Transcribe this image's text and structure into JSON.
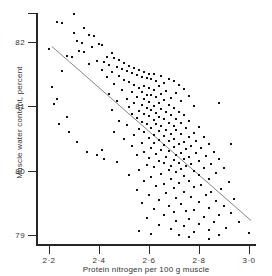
{
  "chart_data": {
    "type": "scatter",
    "title": "",
    "subtitle": "",
    "xlabel": "Protein nitrogen per 100 g muscle",
    "ylabel": "Muscle water content, percent",
    "xlim": [
      2.15,
      3.03
    ],
    "ylim": [
      78.85,
      82.45
    ],
    "grid": false,
    "legend": null,
    "annotations": [],
    "xticks": [
      {
        "value": 2.2,
        "label": "2·2"
      },
      {
        "value": 2.4,
        "label": "2·4"
      },
      {
        "value": 2.6,
        "label": "2·6"
      },
      {
        "value": 2.8,
        "label": "2·8"
      },
      {
        "value": 3.0,
        "label": "3·0"
      }
    ],
    "yticks": [
      {
        "value": 82.45,
        "label": ""
      },
      {
        "value": 82.0,
        "label": "82"
      },
      {
        "value": 81.0,
        "label": "81"
      },
      {
        "value": 80.0,
        "label": "80"
      },
      {
        "value": 79.0,
        "label": "79"
      }
    ],
    "marker": {
      "shape": "square",
      "size_px": 2,
      "color": "#111111"
    },
    "n_points": 248,
    "series": [
      {
        "name": "observations",
        "color": "#111111",
        "points": [
          [
            2.3,
            82.44
          ],
          [
            2.23,
            82.31
          ],
          [
            2.25,
            82.3
          ],
          [
            2.34,
            82.22
          ],
          [
            2.3,
            82.14
          ],
          [
            2.36,
            82.11
          ],
          [
            2.38,
            82.1
          ],
          [
            2.31,
            82.02
          ],
          [
            2.33,
            81.98
          ],
          [
            2.4,
            81.97
          ],
          [
            2.37,
            81.93
          ],
          [
            2.41,
            81.95
          ],
          [
            2.2,
            81.89
          ],
          [
            2.32,
            81.86
          ],
          [
            2.34,
            81.84
          ],
          [
            2.45,
            81.83
          ],
          [
            2.27,
            81.78
          ],
          [
            2.29,
            81.77
          ],
          [
            2.43,
            81.76
          ],
          [
            2.46,
            81.75
          ],
          [
            2.48,
            81.72
          ],
          [
            2.39,
            81.7
          ],
          [
            2.42,
            81.69
          ],
          [
            2.5,
            81.68
          ],
          [
            2.36,
            81.66
          ],
          [
            2.44,
            81.64
          ],
          [
            2.52,
            81.63
          ],
          [
            2.47,
            81.61
          ],
          [
            2.54,
            81.6
          ],
          [
            2.49,
            81.58
          ],
          [
            2.41,
            81.57
          ],
          [
            2.56,
            81.56
          ],
          [
            2.51,
            81.55
          ],
          [
            2.58,
            81.54
          ],
          [
            2.45,
            81.53
          ],
          [
            2.53,
            81.52
          ],
          [
            2.6,
            81.51
          ],
          [
            2.62,
            81.5
          ],
          [
            2.55,
            81.49
          ],
          [
            2.48,
            81.48
          ],
          [
            2.65,
            81.47
          ],
          [
            2.57,
            81.46
          ],
          [
            2.43,
            81.45
          ],
          [
            2.59,
            81.44
          ],
          [
            2.68,
            81.43
          ],
          [
            2.61,
            81.42
          ],
          [
            2.5,
            81.41
          ],
          [
            2.63,
            81.4
          ],
          [
            2.7,
            81.39
          ],
          [
            2.52,
            81.38
          ],
          [
            2.66,
            81.36
          ],
          [
            2.46,
            81.35
          ],
          [
            2.54,
            81.34
          ],
          [
            2.72,
            81.33
          ],
          [
            2.58,
            81.32
          ],
          [
            2.64,
            81.31
          ],
          [
            2.21,
            81.3
          ],
          [
            2.56,
            81.29
          ],
          [
            2.6,
            81.28
          ],
          [
            2.74,
            81.27
          ],
          [
            2.62,
            81.26
          ],
          [
            2.49,
            81.25
          ],
          [
            2.67,
            81.24
          ],
          [
            2.53,
            81.23
          ],
          [
            2.57,
            81.22
          ],
          [
            2.71,
            81.21
          ],
          [
            2.44,
            81.2
          ],
          [
            2.65,
            81.19
          ],
          [
            2.59,
            81.18
          ],
          [
            2.61,
            81.17
          ],
          [
            2.76,
            81.16
          ],
          [
            2.55,
            81.15
          ],
          [
            2.63,
            81.14
          ],
          [
            2.69,
            81.13
          ],
          [
            2.51,
            81.12
          ],
          [
            2.58,
            81.11
          ],
          [
            2.66,
            81.1
          ],
          [
            2.47,
            81.09
          ],
          [
            2.73,
            81.08
          ],
          [
            2.6,
            81.07
          ],
          [
            2.54,
            81.06
          ],
          [
            2.64,
            81.05
          ],
          [
            2.22,
            81.04
          ],
          [
            2.68,
            81.03
          ],
          [
            2.57,
            81.02
          ],
          [
            2.62,
            81.01
          ],
          [
            2.78,
            81.0
          ],
          [
            2.52,
            80.99
          ],
          [
            2.7,
            80.98
          ],
          [
            2.59,
            80.97
          ],
          [
            2.65,
            80.96
          ],
          [
            2.45,
            80.95
          ],
          [
            2.61,
            80.94
          ],
          [
            2.56,
            80.93
          ],
          [
            2.72,
            80.92
          ],
          [
            2.67,
            80.91
          ],
          [
            2.63,
            80.9
          ],
          [
            2.58,
            80.89
          ],
          [
            2.53,
            80.88
          ],
          [
            2.74,
            80.87
          ],
          [
            2.69,
            80.86
          ],
          [
            2.6,
            80.85
          ],
          [
            2.64,
            80.84
          ],
          [
            2.27,
            80.83
          ],
          [
            2.55,
            80.82
          ],
          [
            2.71,
            80.81
          ],
          [
            2.66,
            80.8
          ],
          [
            2.62,
            80.79
          ],
          [
            2.48,
            80.78
          ],
          [
            2.76,
            80.77
          ],
          [
            2.57,
            80.76
          ],
          [
            2.68,
            80.75
          ],
          [
            2.73,
            80.74
          ],
          [
            2.63,
            80.73
          ],
          [
            2.59,
            80.72
          ],
          [
            2.51,
            80.71
          ],
          [
            2.7,
            80.7
          ],
          [
            2.65,
            80.69
          ],
          [
            2.8,
            80.68
          ],
          [
            2.61,
            80.67
          ],
          [
            2.75,
            80.66
          ],
          [
            2.56,
            80.65
          ],
          [
            2.67,
            80.64
          ],
          [
            2.71,
            80.63
          ],
          [
            2.64,
            80.62
          ],
          [
            2.46,
            80.61
          ],
          [
            2.58,
            80.6
          ],
          [
            2.78,
            80.59
          ],
          [
            2.69,
            80.58
          ],
          [
            2.73,
            80.57
          ],
          [
            2.62,
            80.56
          ],
          [
            2.54,
            80.55
          ],
          [
            2.66,
            80.54
          ],
          [
            2.82,
            80.53
          ],
          [
            2.76,
            80.52
          ],
          [
            2.6,
            80.51
          ],
          [
            2.7,
            80.5
          ],
          [
            2.5,
            80.49
          ],
          [
            2.64,
            80.48
          ],
          [
            2.79,
            80.47
          ],
          [
            2.68,
            80.46
          ],
          [
            2.74,
            80.45
          ],
          [
            2.57,
            80.44
          ],
          [
            2.62,
            80.43
          ],
          [
            2.84,
            80.42
          ],
          [
            2.72,
            80.41
          ],
          [
            2.66,
            80.4
          ],
          [
            2.77,
            80.39
          ],
          [
            2.53,
            80.38
          ],
          [
            2.7,
            80.37
          ],
          [
            2.61,
            80.36
          ],
          [
            2.81,
            80.35
          ],
          [
            2.75,
            80.34
          ],
          [
            2.65,
            80.33
          ],
          [
            2.41,
            80.32
          ],
          [
            2.68,
            80.31
          ],
          [
            2.86,
            80.3
          ],
          [
            2.58,
            80.29
          ],
          [
            2.73,
            80.28
          ],
          [
            2.79,
            80.27
          ],
          [
            2.63,
            80.26
          ],
          [
            2.71,
            80.25
          ],
          [
            2.55,
            80.24
          ],
          [
            2.83,
            80.23
          ],
          [
            2.76,
            80.22
          ],
          [
            2.67,
            80.21
          ],
          [
            2.6,
            80.2
          ],
          [
            2.88,
            80.19
          ],
          [
            2.74,
            80.18
          ],
          [
            2.7,
            80.17
          ],
          [
            2.64,
            80.16
          ],
          [
            2.8,
            80.15
          ],
          [
            2.47,
            80.14
          ],
          [
            2.72,
            80.13
          ],
          [
            2.66,
            80.12
          ],
          [
            2.85,
            80.11
          ],
          [
            2.77,
            80.1
          ],
          [
            2.59,
            80.09
          ],
          [
            2.69,
            80.08
          ],
          [
            2.75,
            80.07
          ],
          [
            2.62,
            80.06
          ],
          [
            2.9,
            80.05
          ],
          [
            2.82,
            80.04
          ],
          [
            2.73,
            80.03
          ],
          [
            2.56,
            80.02
          ],
          [
            2.68,
            80.01
          ],
          [
            2.78,
            80.0
          ],
          [
            2.71,
            79.98
          ],
          [
            2.87,
            79.96
          ],
          [
            2.65,
            79.95
          ],
          [
            2.52,
            79.94
          ],
          [
            2.8,
            79.93
          ],
          [
            2.74,
            79.92
          ],
          [
            2.61,
            79.9
          ],
          [
            2.69,
            79.88
          ],
          [
            2.84,
            79.87
          ],
          [
            2.76,
            79.85
          ],
          [
            2.58,
            79.84
          ],
          [
            2.92,
            79.83
          ],
          [
            2.72,
            79.81
          ],
          [
            2.66,
            79.8
          ],
          [
            2.81,
            79.78
          ],
          [
            2.63,
            79.76
          ],
          [
            2.78,
            79.75
          ],
          [
            2.7,
            79.73
          ],
          [
            2.89,
            79.72
          ],
          [
            2.55,
            79.7
          ],
          [
            2.85,
            79.68
          ],
          [
            2.74,
            79.67
          ],
          [
            2.67,
            79.65
          ],
          [
            2.6,
            79.63
          ],
          [
            2.83,
            79.62
          ],
          [
            2.77,
            79.6
          ],
          [
            2.71,
            79.58
          ],
          [
            2.94,
            79.57
          ],
          [
            2.64,
            79.55
          ],
          [
            2.87,
            79.53
          ],
          [
            2.8,
            79.52
          ],
          [
            2.57,
            79.5
          ],
          [
            2.73,
            79.48
          ],
          [
            2.68,
            79.46
          ],
          [
            2.9,
            79.45
          ],
          [
            2.84,
            79.43
          ],
          [
            2.62,
            79.41
          ],
          [
            2.78,
            79.4
          ],
          [
            2.75,
            79.38
          ],
          [
            2.7,
            79.36
          ],
          [
            2.93,
            79.34
          ],
          [
            2.66,
            79.32
          ],
          [
            2.88,
            79.31
          ],
          [
            2.82,
            79.29
          ],
          [
            2.59,
            79.27
          ],
          [
            2.76,
            79.25
          ],
          [
            2.71,
            79.23
          ],
          [
            2.86,
            79.21
          ],
          [
            2.96,
            79.2
          ],
          [
            2.8,
            79.18
          ],
          [
            2.64,
            79.16
          ],
          [
            2.74,
            79.14
          ],
          [
            2.91,
            79.12
          ],
          [
            2.69,
            79.1
          ],
          [
            2.84,
            79.08
          ],
          [
            2.56,
            79.06
          ],
          [
            2.78,
            79.05
          ],
          [
            3.0,
            79.03
          ],
          [
            2.61,
            79.02
          ],
          [
            2.72,
            79.01
          ],
          [
            2.88,
            79.0
          ],
          [
            2.25,
            81.55
          ],
          [
            2.23,
            81.12
          ],
          [
            2.24,
            80.72
          ],
          [
            2.28,
            80.6
          ],
          [
            2.31,
            80.45
          ],
          [
            2.35,
            80.3
          ],
          [
            2.39,
            80.25
          ],
          [
            2.42,
            80.18
          ],
          [
            2.88,
            81.05
          ],
          [
            2.93,
            80.42
          ],
          [
            2.76,
            78.97
          ],
          [
            2.84,
            78.94
          ]
        ]
      }
    ],
    "fit_line": {
      "name": "regression line",
      "color": "#777777",
      "x0": 2.21,
      "y0": 81.93,
      "x1": 3.01,
      "y1": 79.23
    }
  }
}
